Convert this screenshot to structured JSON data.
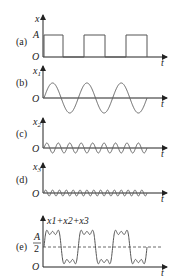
{
  "figure": {
    "panels": [
      {
        "id": "a",
        "label": "(a)",
        "ylabel": "x",
        "ylabel_sub": "",
        "xlabel": "t",
        "origin": "O",
        "level_label": "A",
        "signal": "square wave, amplitude A, 3 periods"
      },
      {
        "id": "b",
        "label": "(b)",
        "ylabel": "x",
        "ylabel_sub": "1",
        "xlabel": "t",
        "origin": "O",
        "signal": "fundamental sine, 3 periods"
      },
      {
        "id": "c",
        "label": "(c)",
        "ylabel": "x",
        "ylabel_sub": "2",
        "xlabel": "t",
        "origin": "O",
        "signal": "3rd harmonic sine, 9 periods"
      },
      {
        "id": "d",
        "label": "(d)",
        "ylabel": "x",
        "ylabel_sub": "3",
        "xlabel": "t",
        "origin": "O",
        "signal": "5th harmonic sine, 15 periods"
      },
      {
        "id": "e",
        "label": "(e)",
        "ylabel": "x1+x2+x3",
        "xlabel": "t",
        "origin": "O",
        "level_num": "A",
        "level_den": "2",
        "signal": "sum of harmonics approximating square wave, dashed line at A/2"
      }
    ]
  },
  "chart_data": [
    {
      "type": "line",
      "title": "(a)",
      "ylabel": "x",
      "xlabel": "t",
      "description": "square wave",
      "levels": [
        0,
        "A"
      ],
      "periods": 3
    },
    {
      "type": "line",
      "title": "(b)",
      "ylabel": "x1",
      "xlabel": "t",
      "description": "sine, fundamental",
      "periods": 3
    },
    {
      "type": "line",
      "title": "(c)",
      "ylabel": "x2",
      "xlabel": "t",
      "description": "sine, 3rd harmonic",
      "periods": 9
    },
    {
      "type": "line",
      "title": "(d)",
      "ylabel": "x3",
      "xlabel": "t",
      "description": "sine, 5th harmonic",
      "periods": 15
    },
    {
      "type": "line",
      "title": "(e)",
      "ylabel": "x1+x2+x3",
      "xlabel": "t",
      "description": "Fourier sum approximating square wave",
      "reference_line": "A/2",
      "periods": 3
    }
  ]
}
